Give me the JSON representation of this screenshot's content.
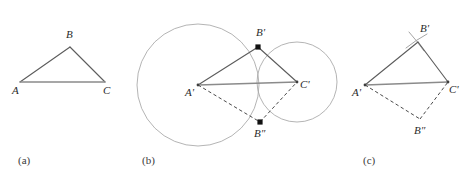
{
  "figure": {
    "width": 463,
    "height": 181,
    "background": "#ffffff",
    "stroke_colors": {
      "triangle_edge": "#5c5c5c",
      "triangle_base": "#8b8b8b",
      "dashed_edge": "#4a4a4a",
      "circle": "#a7a7a7",
      "arc": "#9a9a9a",
      "vertex_marker": "#111111",
      "label_text": "#2b2b2b"
    }
  },
  "panels": [
    {
      "id": "panel-a",
      "caption": "(a)",
      "caption_pos": {
        "x": 18,
        "y": 164
      },
      "description": "Original triangle ABC",
      "vertices": [
        {
          "name": "A",
          "label": "A",
          "x": 20,
          "y": 82,
          "label_x": 12,
          "label_y": 94,
          "marker": "none"
        },
        {
          "name": "B",
          "label": "B",
          "x": 70,
          "y": 47,
          "label_x": 66,
          "label_y": 38,
          "marker": "none"
        },
        {
          "name": "C",
          "label": "C",
          "x": 105,
          "y": 82,
          "label_x": 103,
          "label_y": 94,
          "marker": "none"
        }
      ],
      "edges": [
        {
          "from": "A",
          "to": "B",
          "style": "solid"
        },
        {
          "from": "B",
          "to": "C",
          "style": "solid"
        },
        {
          "from": "A",
          "to": "C",
          "style": "base"
        }
      ],
      "circles": [],
      "arcs": []
    },
    {
      "id": "panel-b",
      "caption": "(b)",
      "caption_pos": {
        "x": 142,
        "y": 164
      },
      "description": "Compass construction: two intersecting circles centered at A-prime and C-prime locate B-prime and B-double-prime",
      "vertices": [
        {
          "name": "Aprime",
          "label": "A'",
          "x": 198,
          "y": 85,
          "label_x": 185,
          "label_y": 96,
          "marker": "dot"
        },
        {
          "name": "Bprime",
          "label": "B'",
          "x": 258,
          "y": 47,
          "label_x": 256,
          "label_y": 36,
          "marker": "square"
        },
        {
          "name": "Cprime",
          "label": "C'",
          "x": 297,
          "y": 82,
          "label_x": 300,
          "label_y": 88,
          "marker": "dot"
        },
        {
          "name": "Bdoubleprime",
          "label": "B″",
          "x": 260,
          "y": 122,
          "label_x": 254,
          "label_y": 137,
          "marker": "square"
        }
      ],
      "edges": [
        {
          "from": "Aprime",
          "to": "Bprime",
          "style": "solid"
        },
        {
          "from": "Bprime",
          "to": "Cprime",
          "style": "solid"
        },
        {
          "from": "Aprime",
          "to": "Cprime",
          "style": "base"
        },
        {
          "from": "Aprime",
          "to": "Bdoubleprime",
          "style": "dashed"
        },
        {
          "from": "Bdoubleprime",
          "to": "Cprime",
          "style": "dashed"
        }
      ],
      "circles": [
        {
          "name": "circle-centered-at-A-prime",
          "cx": 198,
          "cy": 85,
          "r": 61
        },
        {
          "name": "circle-centered-at-C-prime",
          "cx": 297,
          "cy": 82,
          "r": 40
        }
      ],
      "arcs": []
    },
    {
      "id": "panel-c",
      "caption": "(c)",
      "caption_pos": {
        "x": 363,
        "y": 164
      },
      "description": "Resulting congruent triangle with only the small crossing arc marks retained at B-prime",
      "vertices": [
        {
          "name": "Aprime",
          "label": "A'",
          "x": 365,
          "y": 85,
          "label_x": 352,
          "label_y": 96,
          "marker": "dot"
        },
        {
          "name": "Bprime",
          "label": "B'",
          "x": 418,
          "y": 42,
          "label_x": 420,
          "label_y": 32,
          "marker": "none"
        },
        {
          "name": "Cprime",
          "label": "C'",
          "x": 448,
          "y": 82,
          "label_x": 449,
          "label_y": 93,
          "marker": "dot"
        },
        {
          "name": "Bdoubleprime",
          "label": "B″",
          "x": 420,
          "y": 119,
          "label_x": 414,
          "label_y": 134,
          "marker": "none"
        }
      ],
      "edges": [
        {
          "from": "Aprime",
          "to": "Bprime",
          "style": "solid"
        },
        {
          "from": "Bprime",
          "to": "Cprime",
          "style": "solid"
        },
        {
          "from": "Aprime",
          "to": "Cprime",
          "style": "base"
        },
        {
          "from": "Aprime",
          "to": "Bdoubleprime",
          "style": "dashed"
        },
        {
          "from": "Bdoubleprime",
          "to": "Cprime",
          "style": "dashed"
        }
      ],
      "circles": [],
      "arcs": [
        {
          "name": "arc-mark-left-at-B-prime",
          "d": "M 406 48 Q 416 40 427 34"
        },
        {
          "name": "arc-mark-right-at-B-prime",
          "d": "M 409 32 Q 417 41 424 51"
        }
      ]
    }
  ]
}
